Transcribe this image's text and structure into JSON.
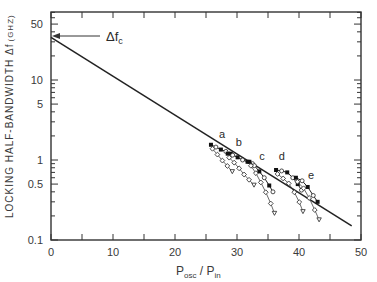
{
  "chart_data": {
    "type": "line",
    "title": "",
    "xlabel": "P_osc / P_in",
    "xlabel_main": "P",
    "xlabel_sub1": "osc",
    "xlabel_sep": " / P",
    "xlabel_sub2": "in",
    "ylabel": "LOCKING HALF-BANDWIDTH Δf (GHZ)",
    "ylabel_main": "LOCKING HALF-BANDWIDTH  Δf",
    "ylabel_unit": "(GHZ)",
    "xlim": [
      0,
      50
    ],
    "ylim": [
      0.1,
      70
    ],
    "yscale": "log",
    "grid": false,
    "x_ticks": [
      0,
      10,
      20,
      30,
      40,
      50
    ],
    "x_tick_labels": [
      "0",
      "10",
      "20",
      "30",
      "40",
      "50"
    ],
    "x_minor_ticks": [
      5,
      15,
      25,
      35,
      45
    ],
    "y_ticks": [
      0.1,
      0.5,
      1,
      5,
      10,
      50
    ],
    "y_tick_labels": [
      "0.1",
      "0.5",
      "1",
      "5",
      "10",
      "50"
    ],
    "annotation": {
      "text": "Δf",
      "subscript": "c",
      "points_to": {
        "x": 0,
        "y": 34
      }
    },
    "series": [
      {
        "name": "theory line",
        "style": "solid line",
        "x": [
          0,
          48.5
        ],
        "y": [
          34,
          0.15
        ]
      },
      {
        "name": "a",
        "style": "filled + open markers",
        "x": [
          25.8,
          26.6,
          27.4,
          28.2,
          29.0
        ],
        "y": [
          1.55,
          1.45,
          1.35,
          1.28,
          1.2
        ]
      },
      {
        "name": "b",
        "style": "filled + open markers",
        "x": [
          28.5,
          29.3,
          30.1,
          30.9,
          31.7,
          32.5
        ],
        "y": [
          1.2,
          1.15,
          1.08,
          1.0,
          0.95,
          0.9
        ]
      },
      {
        "name": "c",
        "style": "filled + open markers",
        "x": [
          32.0,
          32.8,
          33.6,
          34.4,
          35.2,
          35.8
        ],
        "y": [
          0.95,
          0.85,
          0.72,
          0.6,
          0.48,
          0.4
        ]
      },
      {
        "name": "d",
        "style": "filled + open markers",
        "x": [
          36.3,
          37.2,
          38.1,
          39.0,
          39.8,
          40.4
        ],
        "y": [
          0.75,
          0.73,
          0.7,
          0.6,
          0.5,
          0.42
        ]
      },
      {
        "name": "e",
        "style": "filled + open markers",
        "x": [
          39.5,
          40.5,
          41.4,
          42.3,
          43.0
        ],
        "y": [
          0.6,
          0.55,
          0.46,
          0.36,
          0.3
        ]
      }
    ]
  }
}
